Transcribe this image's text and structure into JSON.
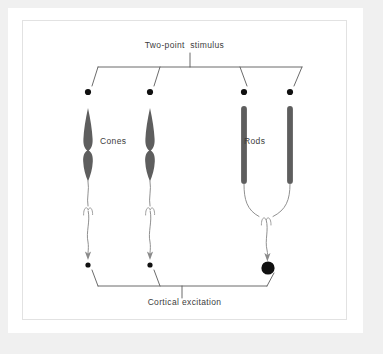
{
  "figure": {
    "title": "Two-point  stimulus",
    "caption": "Cortical excitation",
    "labels": {
      "cones": "Cones",
      "rods": "Rods"
    },
    "colors": {
      "page_background": "#f0f0f0",
      "mat": "#ffffff",
      "plate_border": "#e2e2e2",
      "receptor_fill": "#5e5e5e",
      "line": "#6b6b6b",
      "bracket": "#5a5a5a",
      "dot": "#111111",
      "text": "#3c3c3c"
    },
    "top_bracket": {
      "name": "two-point-stimulus-bracket",
      "stem_label": "Two-point  stimulus",
      "terminal_count": 4
    },
    "bottom_bracket": {
      "name": "cortical-excitation-bracket",
      "stem_label": "Cortical excitation",
      "terminal_count": 3
    },
    "receptors": [
      {
        "type": "cone",
        "name": "cone-1",
        "x": 66,
        "label_group": "Cones"
      },
      {
        "type": "cone",
        "name": "cone-2",
        "x": 128,
        "label_group": "Cones"
      },
      {
        "type": "rod",
        "name": "rod-1",
        "x": 222,
        "label_group": "Rods"
      },
      {
        "type": "rod",
        "name": "rod-2",
        "x": 268,
        "label_group": "Rods"
      }
    ],
    "stimulus_dots": [
      {
        "name": "stimulus-dot-cone-1",
        "x": 66,
        "y": 72,
        "r": 3.1
      },
      {
        "name": "stimulus-dot-cone-2",
        "x": 128,
        "y": 72,
        "r": 3.1
      },
      {
        "name": "stimulus-dot-rod-1",
        "x": 222,
        "y": 72,
        "r": 3.1
      },
      {
        "name": "stimulus-dot-rod-2",
        "x": 268,
        "y": 72,
        "r": 3.1
      }
    ],
    "cortical_dots": [
      {
        "name": "cortical-dot-cone-1",
        "x": 66,
        "y": 245,
        "r": 2.6
      },
      {
        "name": "cortical-dot-cone-2",
        "x": 128,
        "y": 245,
        "r": 2.6
      },
      {
        "name": "cortical-dot-rods-merged",
        "x": 246,
        "y": 246,
        "r": 6.6
      }
    ],
    "pathways": [
      {
        "name": "cone-1-axon",
        "from": "cone-1",
        "to": "cortical-dot-cone-1",
        "converges": false
      },
      {
        "name": "cone-2-axon",
        "from": "cone-2",
        "to": "cortical-dot-cone-2",
        "converges": false
      },
      {
        "name": "rod-convergent-axon",
        "from": "rod-1,rod-2",
        "to": "cortical-dot-rods-merged",
        "converges": true
      }
    ]
  }
}
